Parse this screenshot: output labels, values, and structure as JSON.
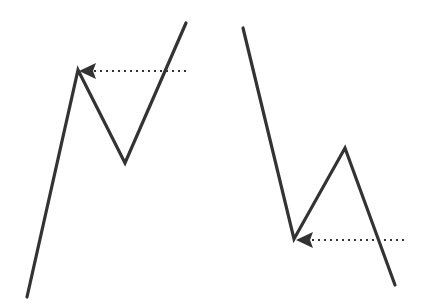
{
  "figure": {
    "background_color": "#ffffff",
    "width": 423,
    "height": 307,
    "line_color": "#333333",
    "line_width": 3.2,
    "dotted_color": "#333333",
    "dotted_width": 2,
    "dash_pattern": "2 4"
  },
  "panels": [
    {
      "name": "left-panel",
      "label": "Rising zigzag with resistance pointer",
      "zigzag": {
        "name": "rising-zigzag",
        "points": "27,297 78,70 125,163 186,23",
        "vertices": [
          {
            "name": "start-low",
            "x": 27,
            "y": 297
          },
          {
            "name": "first-peak",
            "x": 78,
            "y": 70
          },
          {
            "name": "pullback-trough",
            "x": 125,
            "y": 163
          },
          {
            "name": "end-high",
            "x": 186,
            "y": 23
          }
        ]
      },
      "pointer": {
        "name": "resistance-pointer",
        "line_start_x": 186,
        "line_end_x": 92,
        "y": 71,
        "arrow_tip_x": 79,
        "arrow_polygon": "79,71 96,63 93,71 96,79",
        "direction": "left"
      }
    },
    {
      "name": "right-panel",
      "label": "Falling zigzag with support pointer",
      "zigzag": {
        "name": "falling-zigzag",
        "points": "243,28 294,239 345,148 395,285",
        "vertices": [
          {
            "name": "start-high",
            "x": 243,
            "y": 28
          },
          {
            "name": "first-trough",
            "x": 294,
            "y": 239
          },
          {
            "name": "rally-peak",
            "x": 345,
            "y": 148
          },
          {
            "name": "end-low",
            "x": 395,
            "y": 285
          }
        ]
      },
      "pointer": {
        "name": "support-pointer",
        "line_start_x": 404,
        "line_end_x": 309,
        "y": 240,
        "arrow_tip_x": 296,
        "arrow_polygon": "296,240 313,232 310,240 313,248",
        "direction": "left"
      }
    }
  ]
}
